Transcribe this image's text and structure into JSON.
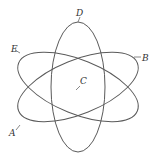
{
  "diagram": {
    "labels": {
      "a": "A",
      "b": "B",
      "c": "C",
      "d": "D",
      "e": "E"
    },
    "caption": "",
    "colors": {
      "line": "#5a5a5a",
      "label": "#333333",
      "background": "#ffffff"
    }
  }
}
